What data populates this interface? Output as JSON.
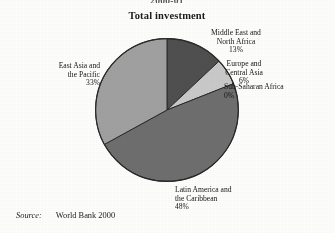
{
  "figure": {
    "cropped_caption_fragment": "2000-01",
    "title": "Total investment",
    "source_label": "Source:",
    "source_value": "World Bank 2000"
  },
  "labels": {
    "mena": {
      "line1": "Middle East and",
      "line2": "North Africa",
      "pct": "13%"
    },
    "eca": {
      "line1": "Europe and",
      "line2": "Central Asia",
      "pct": "6%"
    },
    "ssa": {
      "line1": "Sub-Saharan Africa",
      "line2": "",
      "pct": "0%"
    },
    "eap": {
      "line1": "East Asia and",
      "line2": "the Pacific",
      "pct": "33%"
    },
    "lac": {
      "line1": "Latin America and",
      "line2": "the Caribbean",
      "pct": "48%"
    }
  },
  "chart_data": {
    "type": "pie",
    "title": "Total investment",
    "subtitle": "",
    "xlabel": "",
    "ylabel": "",
    "units": "percent of total",
    "start_angle_deg": 0,
    "direction": "clockwise",
    "legend": "none-inline-labels",
    "grid": false,
    "source": "World Bank 2000",
    "categories": [
      "Middle East and North Africa",
      "Europe and Central Asia",
      "Sub-Saharan Africa",
      "Latin America and the Caribbean",
      "East Asia and the Pacific"
    ],
    "values": [
      13,
      6,
      0,
      48,
      33
    ],
    "value_labels": [
      "13%",
      "6%",
      "0%",
      "48%",
      "33%"
    ],
    "colors": [
      "#4f4f4f",
      "#c9c9c9",
      "#8d8d8d",
      "#6e6e6e",
      "#a0a0a0"
    ],
    "slices": [
      {
        "label": "Middle East and North Africa",
        "value": 13,
        "display": "13%",
        "color": "#4f4f4f"
      },
      {
        "label": "Europe and Central Asia",
        "value": 6,
        "display": "6%",
        "color": "#c9c9c9"
      },
      {
        "label": "Sub-Saharan Africa",
        "value": 0,
        "display": "0%",
        "color": "#8d8d8d"
      },
      {
        "label": "Latin America and the Caribbean",
        "value": 48,
        "display": "48%",
        "color": "#6e6e6e"
      },
      {
        "label": "East Asia and the Pacific",
        "value": 33,
        "display": "33%",
        "color": "#a0a0a0"
      }
    ],
    "total": 100
  }
}
